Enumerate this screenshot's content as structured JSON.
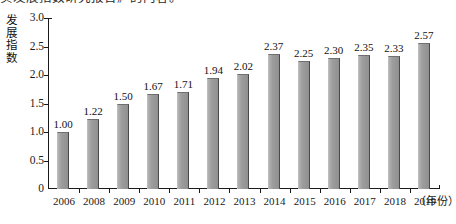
{
  "page": {
    "top_text_fragment": "实发展指数研究报告》的内容。"
  },
  "chart": {
    "y_axis_title_chars": [
      "发",
      "展",
      "指",
      "数"
    ],
    "y_axis_title": "发展指数",
    "x_unit_label": "（年份）"
  },
  "chart_data": {
    "type": "bar",
    "title": "",
    "subtitle": "",
    "xlabel": "年份",
    "ylabel": "发展指数",
    "categories": [
      "2006",
      "2008",
      "2009",
      "2010",
      "2011",
      "2012",
      "2013",
      "2014",
      "2015",
      "2016",
      "2017",
      "2018",
      "2019"
    ],
    "values": [
      1.0,
      1.22,
      1.5,
      1.67,
      1.71,
      1.94,
      2.02,
      2.37,
      2.25,
      2.3,
      2.35,
      2.33,
      2.57
    ],
    "value_labels": [
      "1.00",
      "1.22",
      "1.50",
      "1.67",
      "1.71",
      "1.94",
      "2.02",
      "2.37",
      "2.25",
      "2.30",
      "2.35",
      "2.33",
      "2.57"
    ],
    "ylim": [
      0,
      3.0
    ],
    "yticks": [
      0,
      0.5,
      1.0,
      1.5,
      2.0,
      2.5,
      3.0
    ],
    "ytick_labels": [
      "0",
      "0.5",
      "1.0",
      "1.5",
      "2.0",
      "2.5",
      "3.0"
    ],
    "grid": false,
    "legend": null,
    "bar_color": "#9a9a9a",
    "axis_color": "#1a1a1a"
  }
}
